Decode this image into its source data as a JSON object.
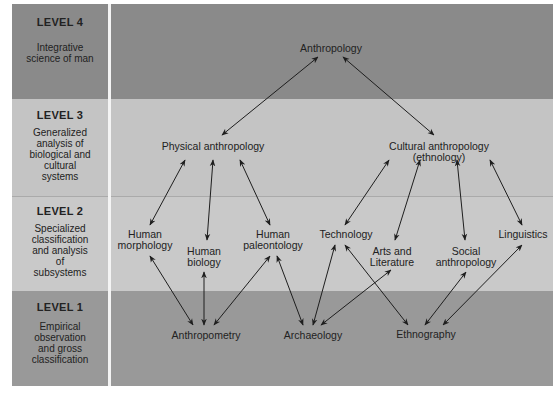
{
  "colors": {
    "level4": "#8a8a8a",
    "level3": "#c4c4c4",
    "level2": "#c9c9c9",
    "level1": "#999999",
    "arrow": "#1e1e1e"
  },
  "levels": [
    {
      "id": "level4",
      "title": "LEVEL 4",
      "description": "Integrative\nscience of man"
    },
    {
      "id": "level3",
      "title": "LEVEL 3",
      "description": "Generalized\nanalysis of\nbiological and\ncultural\nsystems"
    },
    {
      "id": "level2",
      "title": "LEVEL 2",
      "description": "Specialized\nclassification\nand analysis\nof\nsubsystems"
    },
    {
      "id": "level1",
      "title": "LEVEL 1",
      "description": "Empirical\nobservation\nand gross\nclassification"
    }
  ],
  "nodes": {
    "anthropology": "Anthropology",
    "physical": "Physical anthropology",
    "cultural": "Cultural anthropology (ethnology)",
    "morphology": "Human\nmorphology",
    "biology": "Human\nbiology",
    "paleontology": "Human\npaleontology",
    "technology": "Technology",
    "arts": "Arts and\nLiterature",
    "social": "Social\nanthropology",
    "linguistics": "Linguistics",
    "anthropometry": "Anthropometry",
    "archaeology": "Archaeology",
    "ethnography": "Ethnography"
  },
  "edges": [
    [
      "anthropology",
      "physical"
    ],
    [
      "anthropology",
      "cultural"
    ],
    [
      "physical",
      "morphology"
    ],
    [
      "physical",
      "biology"
    ],
    [
      "physical",
      "paleontology"
    ],
    [
      "cultural",
      "technology"
    ],
    [
      "cultural",
      "arts"
    ],
    [
      "cultural",
      "social"
    ],
    [
      "cultural",
      "linguistics"
    ],
    [
      "morphology",
      "anthropometry"
    ],
    [
      "biology",
      "anthropometry"
    ],
    [
      "paleontology",
      "anthropometry"
    ],
    [
      "paleontology",
      "archaeology"
    ],
    [
      "technology",
      "archaeology"
    ],
    [
      "arts",
      "archaeology"
    ],
    [
      "technology",
      "ethnography"
    ],
    [
      "social",
      "ethnography"
    ],
    [
      "linguistics",
      "ethnography"
    ]
  ]
}
